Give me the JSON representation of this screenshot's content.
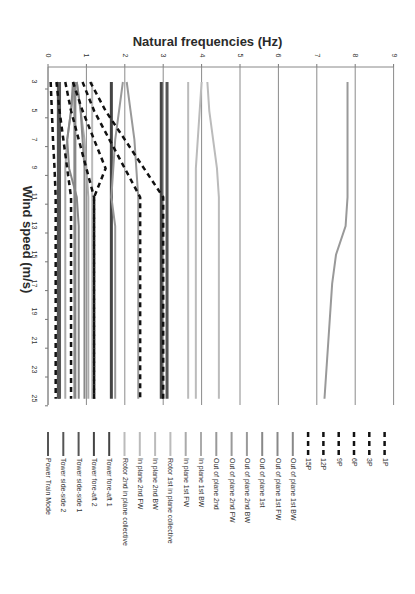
{
  "chart_data": {
    "type": "line",
    "orientation": "rotated-90-clockwise",
    "title": "Natural frequencies (Hz)",
    "xlabel": "Wind speed (m/s)",
    "ylabel": "Natural frequencies (Hz)",
    "x": [
      3,
      5,
      7,
      9,
      11,
      13,
      15,
      17,
      19,
      21,
      23,
      25
    ],
    "x_ticks": [
      "3",
      "5",
      "7",
      "9",
      "11",
      "13",
      "15",
      "17",
      "19",
      "21",
      "23",
      "25"
    ],
    "y_ticks": [
      "0",
      "1",
      "2",
      "3",
      "4",
      "5",
      "6",
      "7",
      "8",
      "9"
    ],
    "ylim": [
      0,
      9
    ],
    "xlim": [
      3,
      25
    ],
    "grid": "major vertical gridlines on frequency axis",
    "legend_position": "bottom (rotated)",
    "series": [
      {
        "name": "Power Train Mode",
        "style": "solid",
        "color": "#555555",
        "width": 3,
        "values": [
          0.27,
          0.27,
          0.27,
          0.27,
          0.27,
          0.27,
          0.27,
          0.27,
          0.27,
          0.27,
          0.27,
          0.27
        ]
      },
      {
        "name": "Tower side-side 2",
        "style": "solid",
        "color": "#555555",
        "width": 3,
        "values": [
          3.1,
          3.1,
          3.1,
          3.1,
          3.1,
          3.1,
          3.1,
          3.1,
          3.1,
          3.1,
          3.1,
          3.1
        ]
      },
      {
        "name": "Tower side-side 1",
        "style": "solid",
        "color": "#555555",
        "width": 3,
        "values": [
          0.3,
          0.3,
          0.3,
          0.3,
          0.3,
          0.3,
          0.3,
          0.3,
          0.3,
          0.3,
          0.3,
          0.3
        ]
      },
      {
        "name": "Tower fore-aft 2",
        "style": "solid",
        "color": "#444444",
        "width": 3,
        "values": [
          2.95,
          2.95,
          2.95,
          2.95,
          2.95,
          2.95,
          2.95,
          2.95,
          2.95,
          2.95,
          2.95,
          2.95
        ]
      },
      {
        "name": "Tower fore-aft 1",
        "style": "solid",
        "color": "#444444",
        "width": 3,
        "values": [
          1.65,
          1.65,
          1.65,
          1.65,
          1.65,
          1.65,
          1.65,
          1.65,
          1.65,
          1.65,
          1.65,
          1.65
        ]
      },
      {
        "name": "Rotor 2nd in plane collective",
        "style": "solid",
        "color": "#bbbbbb",
        "width": 2,
        "values": [
          3.65,
          3.65,
          3.65,
          3.65,
          3.65,
          3.65,
          3.65,
          3.65,
          3.65,
          3.65,
          3.65,
          3.65
        ]
      },
      {
        "name": "In plane 2nd FW",
        "style": "solid",
        "color": "#bbbbbb",
        "width": 2,
        "values": [
          4.15,
          4.2,
          4.3,
          4.4,
          4.45,
          4.45,
          4.45,
          4.45,
          4.45,
          4.45,
          4.45,
          4.45
        ]
      },
      {
        "name": "In plane 2nd BW",
        "style": "solid",
        "color": "#bbbbbb",
        "width": 2,
        "values": [
          4.0,
          3.95,
          3.9,
          3.85,
          3.85,
          3.85,
          3.85,
          3.85,
          3.85,
          3.85,
          3.85,
          3.85
        ]
      },
      {
        "name": "Rotor 1st in plane collective",
        "style": "solid",
        "color": "#bbbbbb",
        "width": 2,
        "values": [
          1.15,
          1.15,
          1.15,
          1.15,
          1.15,
          1.15,
          1.15,
          1.15,
          1.15,
          1.15,
          1.15,
          1.15
        ]
      },
      {
        "name": "In plane 1st FW",
        "style": "solid",
        "color": "#aaaaaa",
        "width": 2,
        "values": [
          0.75,
          0.85,
          0.95,
          1.0,
          1.05,
          1.05,
          1.05,
          1.05,
          1.05,
          1.05,
          1.05,
          1.05
        ]
      },
      {
        "name": "In plane 1st BW",
        "style": "solid",
        "color": "#aaaaaa",
        "width": 2,
        "values": [
          0.7,
          0.6,
          0.5,
          0.45,
          0.45,
          0.45,
          0.45,
          0.45,
          0.45,
          0.45,
          0.45,
          0.45
        ]
      },
      {
        "name": "Out of plane 2nd",
        "style": "solid",
        "color": "#999999",
        "width": 2,
        "values": [
          7.8,
          7.8,
          7.8,
          7.8,
          7.8,
          7.75,
          7.5,
          7.4,
          7.35,
          7.3,
          7.25,
          7.2
        ]
      },
      {
        "name": "Out of plane 2nd FW",
        "style": "solid",
        "color": "#999999",
        "width": 2,
        "values": [
          2.05,
          2.15,
          2.25,
          2.3,
          2.35,
          2.35,
          2.35,
          2.35,
          2.35,
          2.35,
          2.35,
          2.35
        ]
      },
      {
        "name": "Out of plane 2nd BW",
        "style": "solid",
        "color": "#999999",
        "width": 2,
        "values": [
          1.95,
          1.85,
          1.75,
          1.7,
          1.65,
          1.75,
          1.75,
          1.75,
          1.75,
          1.75,
          1.75,
          1.75
        ]
      },
      {
        "name": "Out of plane 1st",
        "style": "solid",
        "color": "#888888",
        "width": 3,
        "values": [
          0.7,
          0.7,
          0.7,
          0.7,
          0.7,
          0.7,
          0.7,
          0.7,
          0.7,
          0.7,
          0.7,
          0.7
        ]
      },
      {
        "name": "Out of plane 1st FW",
        "style": "solid",
        "color": "#888888",
        "width": 2,
        "values": [
          0.75,
          0.85,
          0.9,
          0.95,
          0.95,
          0.95,
          0.95,
          0.95,
          0.95,
          0.95,
          0.95,
          0.95
        ]
      },
      {
        "name": "Out of plane 1st BW",
        "style": "solid",
        "color": "#888888",
        "width": 2,
        "values": [
          0.65,
          0.6,
          0.5,
          0.55,
          0.75,
          0.8,
          0.8,
          0.8,
          0.8,
          0.8,
          0.8,
          0.8
        ]
      },
      {
        "name": "15P",
        "style": "dashed",
        "color": "#111111",
        "width": 2.5,
        "values": [
          1.1,
          1.5,
          2.0,
          2.5,
          3.0,
          3.0,
          3.0,
          3.0,
          3.0,
          3.0,
          3.0,
          3.0
        ]
      },
      {
        "name": "12P",
        "style": "dashed",
        "color": "#111111",
        "width": 2.5,
        "values": [
          0.9,
          1.2,
          1.6,
          2.0,
          2.4,
          2.4,
          2.4,
          2.4,
          2.4,
          2.4,
          2.4,
          2.4
        ]
      },
      {
        "name": "9P",
        "style": "dashed",
        "color": "#111111",
        "width": 2.5,
        "values": [
          0.65,
          0.9,
          1.2,
          1.5,
          1.2,
          1.2,
          1.2,
          1.2,
          1.2,
          1.2,
          1.2,
          1.2
        ]
      },
      {
        "name": "6P",
        "style": "dashed",
        "color": "#111111",
        "width": 2.5,
        "values": [
          0.45,
          0.6,
          0.8,
          1.0,
          1.2,
          1.2,
          1.2,
          1.2,
          1.2,
          1.2,
          1.2,
          1.2
        ]
      },
      {
        "name": "3P",
        "style": "dashed",
        "color": "#111111",
        "width": 2.5,
        "values": [
          0.22,
          0.3,
          0.4,
          0.5,
          0.6,
          0.6,
          0.6,
          0.6,
          0.6,
          0.6,
          0.6,
          0.6
        ]
      },
      {
        "name": "1P",
        "style": "dashed",
        "color": "#111111",
        "width": 2.5,
        "values": [
          0.07,
          0.1,
          0.13,
          0.17,
          0.2,
          0.2,
          0.2,
          0.2,
          0.2,
          0.2,
          0.2,
          0.2
        ]
      }
    ]
  }
}
